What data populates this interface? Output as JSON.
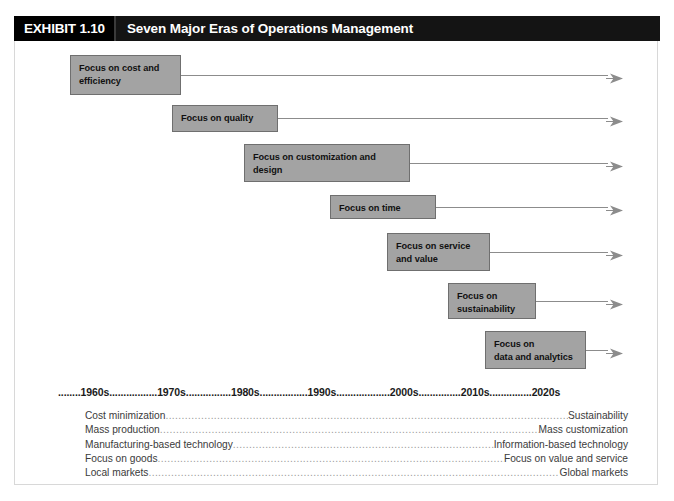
{
  "header": {
    "exhibit_label": "EXHIBIT 1.10",
    "title": "Seven Major Eras of Operations Management"
  },
  "eras": [
    {
      "name": "focus-on-cost-and-efficiency",
      "line1": "Focus on cost and",
      "line2": "efficiency",
      "x": 70,
      "y": 55,
      "w": 111,
      "h": 40,
      "arrow_y": 75
    },
    {
      "name": "focus-on-quality",
      "line1": "Focus on quality",
      "line2": "",
      "x": 172,
      "y": 105,
      "w": 106,
      "h": 27,
      "arrow_y": 118
    },
    {
      "name": "focus-on-customization-and-design",
      "line1": "Focus on customization and",
      "line2": "design",
      "x": 244,
      "y": 144,
      "w": 166,
      "h": 38,
      "arrow_y": 163
    },
    {
      "name": "focus-on-time",
      "line1": "Focus on time",
      "line2": "",
      "x": 330,
      "y": 195,
      "w": 106,
      "h": 24,
      "arrow_y": 207
    },
    {
      "name": "focus-on-service-and-value",
      "line1": "Focus on service",
      "line2": "and value",
      "x": 387,
      "y": 233,
      "w": 103,
      "h": 38,
      "arrow_y": 252
    },
    {
      "name": "focus-on-sustainability",
      "line1": "Focus on",
      "line2": "sustainability",
      "x": 448,
      "y": 283,
      "w": 88,
      "h": 36,
      "arrow_y": 301
    },
    {
      "name": "focus-on-data-and-analytics",
      "line1": "Focus on",
      "line2": "data and analytics",
      "x": 485,
      "y": 331,
      "w": 101,
      "h": 38,
      "arrow_y": 350
    }
  ],
  "arrow_end_x": 622,
  "timeline": {
    "text": "........1960s.................1970s................1980s.................1990s...................2000s...............2010s...............2020s",
    "decades": [
      "1960s",
      "1970s",
      "1980s",
      "1990s",
      "2000s",
      "2010s",
      "2020s"
    ]
  },
  "comparisons": [
    {
      "left": "Cost minimization",
      "right": "Sustainability"
    },
    {
      "left": "Mass production",
      "right": "Mass customization"
    },
    {
      "left": "Manufacturing-based technology",
      "right": "Information-based technology"
    },
    {
      "left": "Focus on goods",
      "right": "Focus on value and service"
    },
    {
      "left": "Local markets",
      "right": "Global markets"
    }
  ],
  "colors": {
    "header_background": "#141414",
    "box_fill": "#a3a3a3",
    "box_border": "#6f6f6f",
    "arrow": "#8c8c8c",
    "frame_border": "#d8d8d8"
  }
}
